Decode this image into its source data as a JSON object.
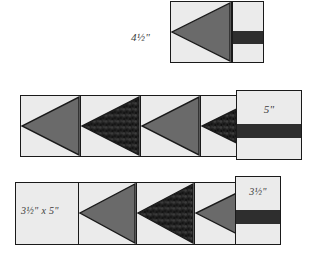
{
  "figure": {
    "colors": {
      "background_fabric": "#ebebeb",
      "solid_triangle": "#6a6a6a",
      "print_triangle": "#252525",
      "band": "#2e2e2e",
      "outline": "#1a1a1a",
      "label_text": "#3a3a3a"
    }
  },
  "top_group": {
    "label": "4½\"",
    "block": {
      "unit_label": "flying-geese-unit",
      "triangle_fabric": "solid"
    },
    "swatch": {
      "has_band": true
    }
  },
  "middle_group": {
    "swatch_label": "5\"",
    "strip": {
      "units": [
        {
          "fabric": "solid"
        },
        {
          "fabric": "print"
        },
        {
          "fabric": "solid"
        },
        {
          "fabric": "print"
        }
      ]
    }
  },
  "bottom_group": {
    "strip_label": "3½\" x 5\"",
    "swatch_label": "3½\"",
    "strip": {
      "units": [
        {
          "fabric": "none"
        },
        {
          "fabric": "solid"
        },
        {
          "fabric": "print"
        },
        {
          "fabric": "solid"
        }
      ]
    }
  }
}
